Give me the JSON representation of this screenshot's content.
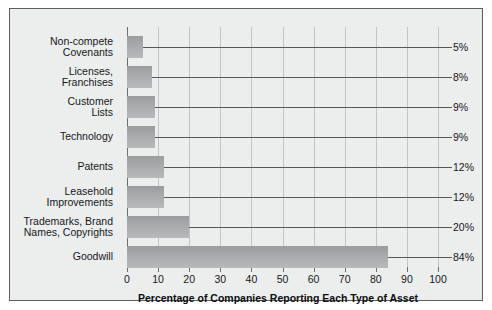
{
  "chart_data": {
    "type": "bar",
    "orientation": "horizontal",
    "title": "",
    "xlabel": "Percentage of Companies Reporting Each Type of Asset",
    "ylabel": "",
    "xlim": [
      0,
      100
    ],
    "xticks": [
      0,
      10,
      20,
      30,
      40,
      50,
      60,
      70,
      80,
      90,
      100
    ],
    "xtick_labels": [
      "0",
      "10",
      "20",
      "30",
      "40",
      "50",
      "60",
      "70",
      "80",
      "90",
      "100"
    ],
    "grid": "vertical",
    "legend": "none",
    "categories": [
      "Non-compete Covenants",
      "Licenses, Franchises",
      "Customer Lists",
      "Technology",
      "Patents",
      "Leasehold Improvements",
      "Trademarks, Brand Names, Copyrights",
      "Goodwill"
    ],
    "category_lines": [
      [
        "Non-compete",
        "Covenants"
      ],
      [
        "Licenses,",
        "Franchises"
      ],
      [
        "Customer",
        "Lists"
      ],
      [
        "Technology"
      ],
      [
        "Patents"
      ],
      [
        "Leasehold",
        "Improvements"
      ],
      [
        "Trademarks, Brand",
        "Names, Copyrights"
      ],
      [
        "Goodwill"
      ]
    ],
    "values": [
      5,
      8,
      9,
      9,
      12,
      12,
      20,
      84
    ],
    "value_labels": [
      "5%",
      "8%",
      "9%",
      "9%",
      "12%",
      "12%",
      "20%",
      "84%"
    ]
  },
  "colors": {
    "background": "#eceded",
    "page": "#ffffff",
    "border": "#5c5f61",
    "bar_top": "#9a9c9e",
    "bar_bottom": "#b7b9ba",
    "gridline": "#c2c4c5",
    "axis": "#6c6f71",
    "leader_line": "#55585a",
    "text": "#16181a"
  }
}
